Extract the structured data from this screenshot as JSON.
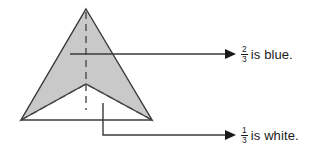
{
  "figure": {
    "shape": {
      "name": "arrow-chevron-polygon",
      "fill_color": "#c9c9c9",
      "stroke_color": "#3a3a3a",
      "dashed_stroke_color": "#4a4a4a"
    },
    "line_color": "#3a3a3a"
  },
  "callouts": [
    {
      "id": "blue",
      "numerator": "2",
      "denominator": "3",
      "text": "is blue.",
      "target": "shaded-region"
    },
    {
      "id": "white",
      "numerator": "1",
      "denominator": "3",
      "text": "is white.",
      "target": "white-notch-region"
    }
  ]
}
